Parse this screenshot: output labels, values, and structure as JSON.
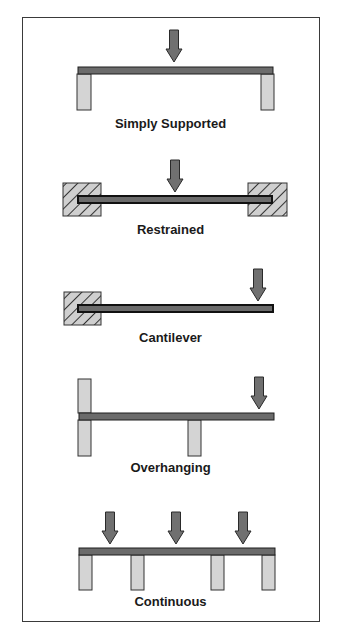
{
  "colors": {
    "beam": "#6b6b6b",
    "beam_outline": "#1e1e1e",
    "support": "#d4d4d4",
    "arrow": "#707070",
    "hatch_fill": "#cfcfcf",
    "frame": "#3a3a3a"
  },
  "diagrams": [
    {
      "id": "simply-supported",
      "label": "Simply Supported"
    },
    {
      "id": "restrained",
      "label": "Restrained"
    },
    {
      "id": "cantilever",
      "label": "Cantilever"
    },
    {
      "id": "overhanging",
      "label": "Overhanging"
    },
    {
      "id": "continuous",
      "label": "Continuous"
    }
  ]
}
